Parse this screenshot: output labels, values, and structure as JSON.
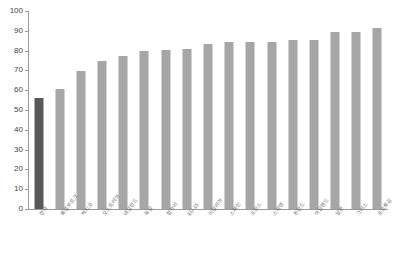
{
  "title_strip": "",
  "chart_data": {
    "type": "bar",
    "title": "",
    "subtitle": "",
    "xlabel": "",
    "ylabel": "",
    "ylim": [
      0,
      100
    ],
    "ytick_step": 10,
    "yticks": [
      "100",
      "90",
      "80",
      "70",
      "60",
      "50",
      "40",
      "30",
      "20",
      "10",
      "0"
    ],
    "grid": false,
    "legend": "none",
    "highlight_index": 0,
    "colors": {
      "bar": "#a6a6a6",
      "bar_highlight": "#595959",
      "axis": "#9a9a9a",
      "tick_text": "#3f3f3f",
      "category_text": "#6e6e6e",
      "background": "#ffffff"
    },
    "categories": [
      "한국",
      "룩셈부르크",
      "멕시코",
      "오스트리아",
      "네덜란드",
      "독일",
      "헝가리",
      "EU 15",
      "이탈리아",
      "스페인",
      "프랑스",
      "스웨덴",
      "핀란드",
      "아일랜드",
      "일본",
      "그리스",
      "포르투갈"
    ],
    "values": [
      56.0,
      60.5,
      69.5,
      74.7,
      77.3,
      80.0,
      80.5,
      81.0,
      83.5,
      84.1,
      84.3,
      84.3,
      85.2,
      85.3,
      89.6,
      89.5,
      91.4
    ]
  }
}
